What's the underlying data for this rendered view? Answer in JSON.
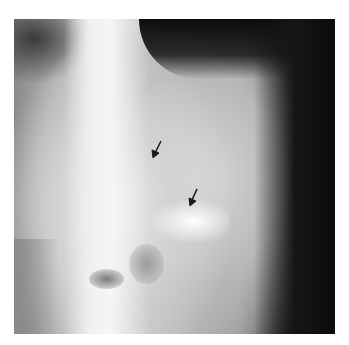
{
  "figure": {
    "type": "radiograph",
    "arrows": [
      {
        "tip_x": 153,
        "tip_y": 157,
        "direction": "down-left"
      },
      {
        "tip_x": 190,
        "tip_y": 207,
        "direction": "down-left"
      }
    ],
    "colors": {
      "background": "#ffffff",
      "dark": "#111111",
      "bright": "#f4f4f4",
      "arrow": "#1a1a1a"
    }
  }
}
